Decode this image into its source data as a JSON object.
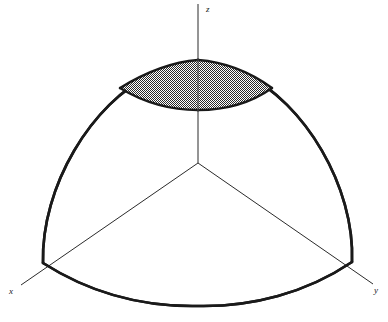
{
  "figure": {
    "kind": "3d-math-diagram",
    "background_color": "#ffffff",
    "line_color": "#1a1a1a",
    "axis_line_color": "#2b2b2b",
    "outline_stroke_width": 2.6,
    "axis_stroke_width": 1.0,
    "shading": {
      "name": "stipple-fill",
      "pattern": "fine-dot-checker",
      "dot_color": "#2a2a2a",
      "base_color": "#ffffff",
      "cell_size_px": 2
    }
  },
  "axes": {
    "origin": {
      "x": 198,
      "y": 163
    },
    "items": [
      {
        "id": "z",
        "label": "z",
        "label_x": 206,
        "label_y": 12,
        "from": {
          "x": 198,
          "y": 163
        },
        "to": {
          "x": 198,
          "y": 4
        }
      },
      {
        "id": "x",
        "label": "x",
        "label_x": 9,
        "label_y": 294,
        "from": {
          "x": 198,
          "y": 163
        },
        "to": {
          "x": 21,
          "y": 285
        }
      },
      {
        "id": "y",
        "label": "y",
        "label_x": 374,
        "label_y": 293,
        "from": {
          "x": 198,
          "y": 163
        },
        "to": {
          "x": 373,
          "y": 284
        }
      }
    ]
  },
  "surface": {
    "name": "spherical-octant-surface",
    "vertices": {
      "pole": {
        "x": 198,
        "y": 62
      },
      "left_base": {
        "x": 43,
        "y": 263
      },
      "right_base": {
        "x": 352,
        "y": 262
      },
      "front_base_mid": {
        "x": 198,
        "y": 306
      }
    },
    "outline_path": "M 43 263 C 41 186, 92 103, 152 74 C 169 66, 186 62, 198 61 C 211 62, 228 66, 245 74 C 304 103, 355 186, 352 262 C 306 293, 252 307, 198 306 C 144 307, 90 293, 43 263 Z",
    "left_meridian_path": "M 43 263 C 41 186, 92 103, 152 74 C 169 66, 186 62, 198 61",
    "right_meridian_path": "M 198 61 C 211 62, 228 66, 245 74 C 304 103, 355 186, 352 262",
    "front_equator_path": "M 43 263 C 90 293, 144 307, 198 306 C 252 307, 306 293, 352 262"
  },
  "patch": {
    "name": "shaded-spherical-patch",
    "is_shaded": true,
    "vertices": {
      "apex": {
        "x": 198,
        "y": 60
      },
      "left": {
        "x": 120,
        "y": 88
      },
      "right": {
        "x": 272,
        "y": 88
      },
      "bottom_mid": {
        "x": 198,
        "y": 110
      }
    },
    "fill_path": "M 120 88 C 146 72, 172 62, 198 60 C 224 62, 250 72, 272 88 C 251 103, 225 110, 198 110 C 171 110, 143 102, 120 88 Z",
    "top_left_edge_path": "M 120 88 C 146 72, 172 62, 198 60",
    "top_right_edge_path": "M 198 60 C 224 62, 250 72, 272 88",
    "bottom_arc_path": "M 120 88 C 143 102, 171 110, 198 110 C 225 110, 251 103, 272 88"
  }
}
